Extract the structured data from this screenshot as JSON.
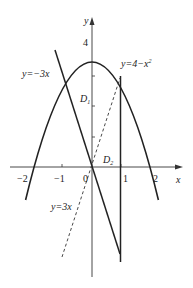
{
  "figure": {
    "type": "function-graph",
    "axes": {
      "x_label": "x",
      "y_label": "y",
      "origin_label": "0",
      "x_ticks": [
        {
          "value": -2,
          "label": "−2"
        },
        {
          "value": -1,
          "label": "−1"
        },
        {
          "value": 1,
          "label": "1"
        },
        {
          "value": 2,
          "label": "2"
        }
      ],
      "y_ticks": [
        {
          "value": 4,
          "label": "4"
        }
      ]
    },
    "curves": [
      {
        "id": "parabola",
        "equation_label": "y=4−x²",
        "label_main": "y=4−x",
        "label_sup": "2",
        "style": "solid"
      },
      {
        "id": "line-neg3x",
        "equation_label": "y=−3x",
        "style": "solid"
      },
      {
        "id": "line-3x",
        "equation_label": "y=3x",
        "style": "dashed"
      },
      {
        "id": "vertical-x1",
        "equation_label": "x=1",
        "style": "solid"
      }
    ],
    "regions": [
      {
        "label_main": "D",
        "label_sub": "1"
      },
      {
        "label_main": "D",
        "label_sub": "2"
      }
    ],
    "colors": {
      "stroke": "#222222",
      "background": "#ffffff"
    }
  }
}
